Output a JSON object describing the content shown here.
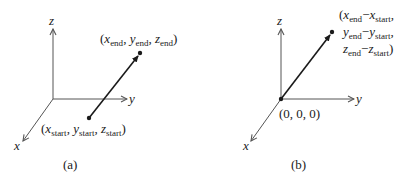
{
  "panels": [
    {
      "id": "a",
      "caption": "(a)",
      "axes": {
        "x": "x",
        "y": "y",
        "z": "z"
      },
      "start_point": {
        "x": "x",
        "y": "y",
        "z": "z",
        "sub": "start"
      },
      "end_point": {
        "x": "x",
        "y": "y",
        "z": "z",
        "sub": "end"
      },
      "geometry": {
        "origin": [
          53,
          99
        ],
        "z_end": [
          53,
          28
        ],
        "y_end": [
          128,
          99
        ],
        "x_end": [
          22,
          142
        ],
        "vec_start": [
          89,
          118
        ],
        "vec_end": [
          140,
          53
        ]
      }
    },
    {
      "id": "b",
      "caption": "(b)",
      "axes": {
        "x": "x",
        "y": "y",
        "z": "z"
      },
      "origin_label": "(0, 0, 0)",
      "end_label": {
        "line1": {
          "a": "x",
          "a_sub": "end",
          "b": "x",
          "b_sub": "start"
        },
        "line2": {
          "a": "y",
          "a_sub": "end",
          "b": "y",
          "b_sub": "start"
        },
        "line3": {
          "a": "z",
          "a_sub": "end",
          "b": "z",
          "b_sub": "start"
        }
      },
      "geometry": {
        "origin": [
          281,
          99
        ],
        "z_end": [
          281,
          28
        ],
        "y_end": [
          355,
          99
        ],
        "x_end": [
          250,
          142
        ],
        "vec_start": [
          281,
          99
        ],
        "vec_end": [
          332,
          32
        ]
      }
    }
  ],
  "colors": {
    "ink": "#1a1a1a",
    "axis": "#555555",
    "background": "#ffffff"
  }
}
